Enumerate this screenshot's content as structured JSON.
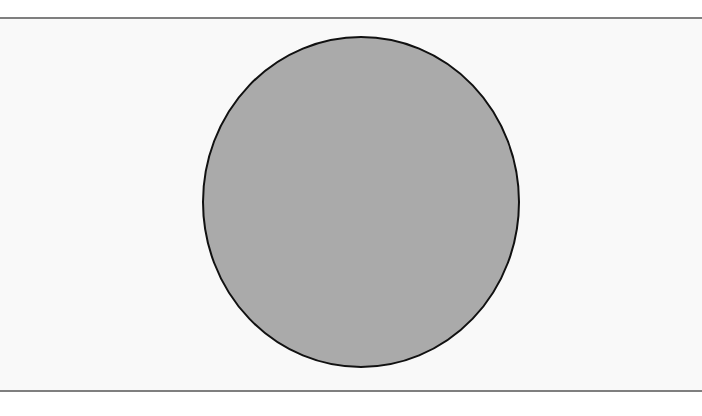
{
  "canvas": {
    "width": 702,
    "height": 416,
    "background": "#ffffff",
    "panel_background": "#f9f9f9"
  },
  "dividers": {
    "color": "#7f7f7f",
    "top_y": 17,
    "bottom_y": 390
  },
  "shape": {
    "type": "ellipse",
    "label": "circle",
    "cx": 361,
    "cy": 202,
    "rx": 158,
    "ry": 165,
    "fill": "#aaaaaa",
    "stroke": "#111111",
    "stroke_width": 2
  }
}
